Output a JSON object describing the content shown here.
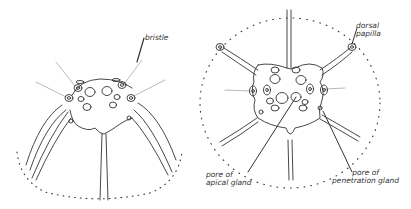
{
  "figure": {
    "left_panel": {
      "labels": [
        {
          "id": "bristle",
          "text": "bristle"
        }
      ]
    },
    "right_panel": {
      "labels": [
        {
          "id": "dorsal-papilla",
          "line1": "dorsal",
          "line2": "papilla"
        },
        {
          "id": "pore-apical",
          "line1": "pore of",
          "line2": "apical gland"
        },
        {
          "id": "pore-penetration",
          "line1": "pore of",
          "line2": "penetration gland"
        }
      ]
    },
    "colors": {
      "ink": "#333333",
      "bristle": "#9a9a9a",
      "background": "#ffffff"
    }
  }
}
